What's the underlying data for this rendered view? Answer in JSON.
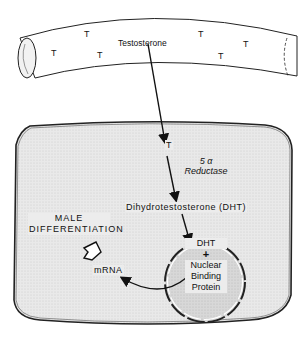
{
  "diagram": {
    "type": "biological-process",
    "vessel": {
      "label": "Testosterone",
      "molecule_symbols": [
        "T",
        "T",
        "T",
        "T",
        "T",
        "T"
      ]
    },
    "cell": {
      "entry_symbol": "T",
      "enzyme": {
        "line1": "5 α",
        "line2": "Reductase"
      },
      "product": "Dihydrotestosterone (DHT)",
      "nucleus": {
        "line1": "DHT",
        "line2": "+",
        "line3": "Nuclear",
        "line4": "Binding",
        "line5": "Protein"
      },
      "mrna": "mRNA",
      "outcome": {
        "line1": "MALE",
        "line2": "DIFFERENTIATION"
      }
    },
    "colors": {
      "cell_fill": "#e6e6e6",
      "nucleus_fill": "#d4d4d4",
      "stroke": "#222222",
      "background": "#ffffff"
    }
  }
}
